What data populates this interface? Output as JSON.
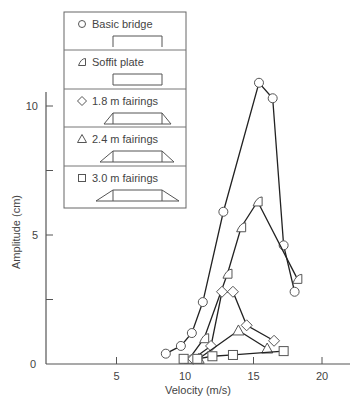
{
  "chart_data": {
    "type": "line",
    "title": "",
    "xlabel": "Velocity (m/s)",
    "ylabel": "Amplitude (cm)",
    "xlim": [
      0,
      22
    ],
    "ylim": [
      0,
      11.2
    ],
    "x_ticks": [
      5,
      10,
      15,
      20
    ],
    "y_ticks": [
      0,
      5,
      10
    ],
    "y_minor_ticks": [
      2.5,
      7.5
    ],
    "grid": false,
    "legend_position": "upper-left",
    "series": [
      {
        "name": "Basic bridge",
        "marker": "circle",
        "section": "basic",
        "x": [
          8.6,
          9.7,
          10.5,
          11.3,
          12.8,
          15.4,
          16.4,
          17.2,
          18.0
        ],
        "y": [
          0.4,
          0.7,
          1.2,
          2.4,
          5.9,
          10.9,
          10.3,
          4.6,
          2.8
        ]
      },
      {
        "name": "Soffit plate",
        "marker": "soffit",
        "section": "soffit",
        "x": [
          10.3,
          11.4,
          13.1,
          14.1,
          15.3,
          18.2
        ],
        "y": [
          0.2,
          1.0,
          3.5,
          5.3,
          6.3,
          3.3
        ]
      },
      {
        "name": "1.8 m fairings",
        "marker": "diamond",
        "section": "fairing-small",
        "x": [
          10.6,
          11.9,
          12.7,
          13.5,
          14.5,
          16.5
        ],
        "y": [
          0.2,
          0.7,
          2.8,
          2.8,
          1.5,
          0.9
        ]
      },
      {
        "name": "2.4 m fairings",
        "marker": "triangle",
        "section": "fairing-medium",
        "x": [
          11.0,
          13.9,
          16.0
        ],
        "y": [
          0.2,
          1.3,
          0.6
        ]
      },
      {
        "name": "3.0 m fairings",
        "marker": "square",
        "section": "fairing-large",
        "x": [
          10.9,
          12.0,
          13.5,
          17.2
        ],
        "y": [
          0.2,
          0.3,
          0.35,
          0.5
        ],
        "extra_points": [
          {
            "x": 9.9,
            "y": 0.2
          }
        ]
      }
    ]
  }
}
